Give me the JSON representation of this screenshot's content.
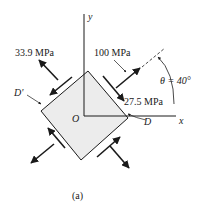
{
  "figure": {
    "caption": "(a)",
    "axes": {
      "x_label": "x",
      "y_label": "y",
      "origin_label": "O"
    },
    "points": {
      "D": "D",
      "D_prime": "D'"
    },
    "stresses": {
      "normal_1": "100 MPa",
      "normal_2": "33.9 MPa",
      "shear": "27.5 MPa"
    },
    "angle": {
      "label": "θ = 40°",
      "value_deg": 40
    },
    "colors": {
      "element_fill": "#ececec",
      "ink": "#1a1a1a"
    }
  }
}
